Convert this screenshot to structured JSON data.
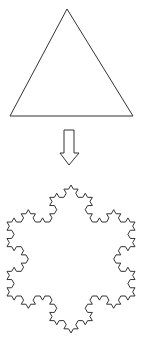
{
  "figure": {
    "width": 143,
    "height": 342,
    "stroke_color": "#333333",
    "background": "#ffffff"
  },
  "triangle": {
    "points": [
      [
        67,
        9
      ],
      [
        133,
        116
      ],
      [
        10,
        116
      ]
    ],
    "label": "triangle"
  },
  "arrow": {
    "direction": "down",
    "shaft": {
      "x1": 64,
      "x2": 74,
      "y_top": 130,
      "y_bottom": 153
    },
    "head": {
      "left_x": 60,
      "right_x": 79,
      "y": 153,
      "tip_y": 165
    }
  },
  "snowflake": {
    "iterations": 3,
    "vertices": [
      [
        71,
        185
      ],
      [
        135,
        296
      ],
      [
        7,
        296
      ]
    ],
    "label": "koch-snowflake"
  }
}
